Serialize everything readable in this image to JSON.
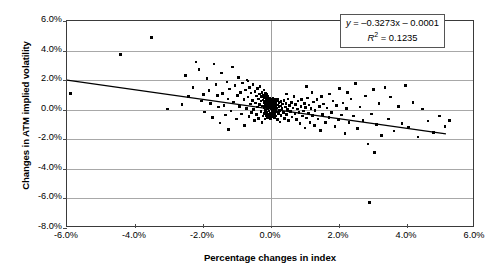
{
  "chart_data": {
    "type": "scatter",
    "title": "",
    "xlabel": "Percentage changes in index",
    "ylabel": "Changes in ATM implied volatility",
    "xlim": [
      -6.0,
      6.0
    ],
    "ylim": [
      -8.0,
      6.0
    ],
    "xticks": [
      "-6.0%",
      "-4.0%",
      "-2.0%",
      "0.0%",
      "2.0%",
      "4.0%",
      "6.0%"
    ],
    "yticks": [
      "6.0%",
      "4.0%",
      "2.0%",
      "0.0%",
      "-2.0%",
      "-4.0%",
      "-6.0%",
      "-8.0%"
    ],
    "xtick_values": [
      -6,
      -4,
      -2,
      0,
      2,
      4,
      6
    ],
    "ytick_values": [
      6,
      4,
      2,
      0,
      -2,
      -4,
      -6,
      -8
    ],
    "grid": "horizontal",
    "legend": "none",
    "units": "percent",
    "marker": "filled-diamond",
    "marker_color": "#000000",
    "trendline": {
      "slope": -0.3273,
      "intercept": -0.0001,
      "r_squared": 0.1235,
      "x_start": -6.0,
      "y_start": 1.96,
      "x_end": 5.2,
      "y_end": -1.71,
      "color": "#000000"
    },
    "annotation": {
      "equation": "y = -0.3273x - 0.0001",
      "equation_lhs": "y",
      "equation_rhs": " = –0.3273x – 0.0001",
      "r2_label": "R",
      "r2_exp": "2",
      "r2_value": " = 0.1235"
    },
    "n_points": 252,
    "points": [
      [
        -5.9,
        1.1
      ],
      [
        -4.42,
        3.74
      ],
      [
        -3.52,
        4.88
      ],
      [
        -3.05,
        0.05
      ],
      [
        -2.52,
        2.32
      ],
      [
        -2.42,
        0.88
      ],
      [
        -2.3,
        1.5
      ],
      [
        -2.2,
        3.22
      ],
      [
        -2.12,
        2.72
      ],
      [
        -2.05,
        0.6
      ],
      [
        -1.98,
        1.02
      ],
      [
        -1.95,
        -0.15
      ],
      [
        -1.88,
        2.1
      ],
      [
        -1.82,
        1.28
      ],
      [
        -1.78,
        0.42
      ],
      [
        -1.72,
        -0.52
      ],
      [
        -1.68,
        3.1
      ],
      [
        -1.62,
        1.7
      ],
      [
        -1.58,
        0.95
      ],
      [
        -1.55,
        0.18
      ],
      [
        -1.5,
        -0.9
      ],
      [
        -1.46,
        2.48
      ],
      [
        -1.42,
        1.08
      ],
      [
        -1.38,
        0.3
      ],
      [
        -1.34,
        -0.35
      ],
      [
        -1.3,
        1.88
      ],
      [
        -1.26,
        0.72
      ],
      [
        -1.22,
        1.4
      ],
      [
        -1.18,
        -0.08
      ],
      [
        -1.14,
        2.9
      ],
      [
        -1.1,
        0.52
      ],
      [
        -1.06,
        1.62
      ],
      [
        -1.02,
        -0.62
      ],
      [
        -0.98,
        0.98
      ],
      [
        -0.95,
        2.18
      ],
      [
        -0.92,
        0.22
      ],
      [
        -0.89,
        1.18
      ],
      [
        -0.86,
        -0.28
      ],
      [
        -0.83,
        1.82
      ],
      [
        -0.8,
        0.68
      ],
      [
        -0.78,
        -1.05
      ],
      [
        -0.75,
        1.32
      ],
      [
        -0.72,
        0.08
      ],
      [
        -0.7,
        2.02
      ],
      [
        -0.68,
        0.85
      ],
      [
        -0.65,
        -0.45
      ],
      [
        -0.63,
        1.52
      ],
      [
        -0.61,
        0.38
      ],
      [
        -0.59,
        1.12
      ],
      [
        -0.57,
        -0.18
      ],
      [
        -0.55,
        0.62
      ],
      [
        -0.53,
        1.72
      ],
      [
        -0.51,
        0.02
      ],
      [
        -0.49,
        -0.72
      ],
      [
        -0.47,
        1.25
      ],
      [
        -0.45,
        0.45
      ],
      [
        -0.43,
        0.92
      ],
      [
        -0.42,
        -0.32
      ],
      [
        -0.4,
        1.45
      ],
      [
        -0.39,
        0.18
      ],
      [
        -0.37,
        0.72
      ],
      [
        -0.36,
        -0.58
      ],
      [
        -0.34,
        1.05
      ],
      [
        -0.33,
        0.35
      ],
      [
        -0.32,
        1.58
      ],
      [
        -0.3,
        -0.12
      ],
      [
        -0.29,
        0.58
      ],
      [
        -0.28,
        0.88
      ],
      [
        -0.27,
        -0.85
      ],
      [
        -0.26,
        1.18
      ],
      [
        -0.25,
        0.25
      ],
      [
        -0.24,
        0.65
      ],
      [
        -0.23,
        -0.42
      ],
      [
        -0.22,
        0.98
      ],
      [
        -0.21,
        0.12
      ],
      [
        -0.2,
        1.32
      ],
      [
        -0.195,
        0.48
      ],
      [
        -0.19,
        -0.25
      ],
      [
        -0.185,
        0.78
      ],
      [
        -0.18,
        0.32
      ],
      [
        -0.175,
        -0.62
      ],
      [
        -0.17,
        1.08
      ],
      [
        -0.165,
        0.18
      ],
      [
        -0.16,
        0.55
      ],
      [
        -0.155,
        -0.05
      ],
      [
        -0.15,
        0.85
      ],
      [
        -0.145,
        0.42
      ],
      [
        -0.14,
        -0.38
      ],
      [
        -0.135,
        0.68
      ],
      [
        -0.13,
        0.22
      ],
      [
        -0.125,
        1.02
      ],
      [
        -0.12,
        -0.18
      ],
      [
        -0.115,
        0.48
      ],
      [
        -0.11,
        0.75
      ],
      [
        -0.105,
        -0.52
      ],
      [
        -0.1,
        0.32
      ],
      [
        -0.095,
        0.62
      ],
      [
        -0.09,
        0.05
      ],
      [
        -0.085,
        0.88
      ],
      [
        -0.08,
        -0.28
      ],
      [
        -0.075,
        0.42
      ],
      [
        -0.07,
        0.18
      ],
      [
        -0.065,
        0.68
      ],
      [
        -0.06,
        -0.08
      ],
      [
        -0.055,
        0.52
      ],
      [
        -0.05,
        0.28
      ],
      [
        -0.045,
        -0.45
      ],
      [
        -0.04,
        0.75
      ],
      [
        -0.035,
        0.12
      ],
      [
        -0.03,
        0.45
      ],
      [
        -0.025,
        -0.22
      ],
      [
        -0.02,
        0.62
      ],
      [
        -0.015,
        0.22
      ],
      [
        -0.01,
        -0.62
      ],
      [
        -0.005,
        0.38
      ],
      [
        0.0,
        0.08
      ],
      [
        0.005,
        0.55
      ],
      [
        0.01,
        -0.32
      ],
      [
        0.015,
        0.28
      ],
      [
        0.02,
        0.68
      ],
      [
        0.025,
        -0.12
      ],
      [
        0.03,
        0.42
      ],
      [
        0.035,
        0.15
      ],
      [
        0.04,
        -0.48
      ],
      [
        0.045,
        0.58
      ],
      [
        0.05,
        0.25
      ],
      [
        0.055,
        -0.05
      ],
      [
        0.06,
        0.78
      ],
      [
        0.065,
        0.35
      ],
      [
        0.07,
        -0.38
      ],
      [
        0.075,
        0.18
      ],
      [
        0.08,
        0.48
      ],
      [
        0.085,
        -0.18
      ],
      [
        0.09,
        0.62
      ],
      [
        0.095,
        0.08
      ],
      [
        0.1,
        -0.55
      ],
      [
        0.105,
        0.38
      ],
      [
        0.11,
        0.22
      ],
      [
        0.115,
        -0.28
      ],
      [
        0.12,
        0.52
      ],
      [
        0.125,
        0.02
      ],
      [
        0.13,
        0.72
      ],
      [
        0.135,
        -0.42
      ],
      [
        0.14,
        0.28
      ],
      [
        0.15,
        0.45
      ],
      [
        0.16,
        -0.15
      ],
      [
        0.17,
        0.58
      ],
      [
        0.18,
        0.12
      ],
      [
        0.19,
        -0.68
      ],
      [
        0.2,
        0.32
      ],
      [
        0.21,
        0.68
      ],
      [
        0.22,
        -0.25
      ],
      [
        0.23,
        0.18
      ],
      [
        0.24,
        0.48
      ],
      [
        0.25,
        -0.05
      ],
      [
        0.26,
        -0.82
      ],
      [
        0.28,
        0.25
      ],
      [
        0.29,
        0.55
      ],
      [
        0.3,
        -0.38
      ],
      [
        0.32,
        0.08
      ],
      [
        0.34,
        0.38
      ],
      [
        0.36,
        -0.18
      ],
      [
        0.38,
        0.62
      ],
      [
        0.4,
        -0.58
      ],
      [
        0.42,
        0.18
      ],
      [
        0.44,
        0.42
      ],
      [
        0.46,
        -0.32
      ],
      [
        0.48,
        0.02
      ],
      [
        0.5,
        0.72
      ],
      [
        0.52,
        -0.72
      ],
      [
        0.55,
        0.28
      ],
      [
        0.58,
        -0.12
      ],
      [
        0.6,
        0.48
      ],
      [
        0.62,
        -0.48
      ],
      [
        0.65,
        0.12
      ],
      [
        0.68,
        0.88
      ],
      [
        0.7,
        -0.28
      ],
      [
        0.72,
        0.35
      ],
      [
        0.75,
        -0.65
      ],
      [
        0.78,
        0.05
      ],
      [
        0.8,
        0.58
      ],
      [
        0.82,
        -0.18
      ],
      [
        0.85,
        -0.92
      ],
      [
        0.88,
        0.22
      ],
      [
        0.9,
        0.68
      ],
      [
        0.92,
        -0.42
      ],
      [
        0.95,
        -0.08
      ],
      [
        0.98,
        0.42
      ],
      [
        1.0,
        -1.25
      ],
      [
        1.02,
        0.15
      ],
      [
        1.05,
        -0.55
      ],
      [
        1.08,
        0.78
      ],
      [
        1.1,
        -0.22
      ],
      [
        1.12,
        0.32
      ],
      [
        1.15,
        -0.88
      ],
      [
        1.18,
        0.08
      ],
      [
        1.2,
        1.18
      ],
      [
        1.22,
        -0.38
      ],
      [
        1.25,
        0.52
      ],
      [
        1.28,
        -1.05
      ],
      [
        1.3,
        -0.05
      ],
      [
        1.35,
        0.68
      ],
      [
        1.38,
        -0.62
      ],
      [
        1.42,
        0.22
      ],
      [
        1.45,
        -1.42
      ],
      [
        1.48,
        0.88
      ],
      [
        1.52,
        -0.32
      ],
      [
        1.55,
        0.38
      ],
      [
        1.6,
        -0.85
      ],
      [
        1.65,
        0.12
      ],
      [
        1.7,
        -0.52
      ],
      [
        1.72,
        1.05
      ],
      [
        1.78,
        -0.18
      ],
      [
        1.82,
        0.58
      ],
      [
        1.88,
        -1.15
      ],
      [
        1.92,
        0.28
      ],
      [
        1.98,
        -0.68
      ],
      [
        2.02,
        1.42
      ],
      [
        2.08,
        -0.35
      ],
      [
        2.12,
        0.45
      ],
      [
        2.18,
        -1.62
      ],
      [
        2.22,
        0.08
      ],
      [
        2.3,
        -0.88
      ],
      [
        2.35,
        0.72
      ],
      [
        2.42,
        -0.42
      ],
      [
        2.48,
        1.78
      ],
      [
        2.55,
        -1.28
      ],
      [
        2.62,
        0.18
      ],
      [
        2.7,
        -0.72
      ],
      [
        2.78,
        0.92
      ],
      [
        2.85,
        -2.32
      ],
      [
        2.9,
        -6.28
      ],
      [
        2.95,
        -0.28
      ],
      [
        3.02,
        1.38
      ],
      [
        3.1,
        -1.02
      ],
      [
        3.18,
        0.42
      ],
      [
        3.25,
        -1.75
      ],
      [
        3.35,
        1.52
      ],
      [
        3.45,
        -0.62
      ],
      [
        3.52,
        0.85
      ],
      [
        3.62,
        -1.45
      ],
      [
        3.75,
        0.22
      ],
      [
        3.85,
        -0.95
      ],
      [
        3.95,
        1.62
      ],
      [
        4.05,
        -1.18
      ],
      [
        4.18,
        0.48
      ],
      [
        4.32,
        -1.85
      ],
      [
        4.45,
        0.05
      ],
      [
        4.62,
        -0.75
      ],
      [
        4.78,
        -1.55
      ],
      [
        4.95,
        -0.42
      ],
      [
        5.12,
        -1.12
      ],
      [
        5.25,
        -0.72
      ],
      [
        -2.62,
        0.35
      ],
      [
        -1.25,
        -1.32
      ],
      [
        2.25,
        1.15
      ],
      [
        3.05,
        -2.88
      ],
      [
        1.05,
        1.55
      ],
      [
        0.45,
        1.05
      ],
      [
        -0.68,
        1.95
      ]
    ]
  }
}
